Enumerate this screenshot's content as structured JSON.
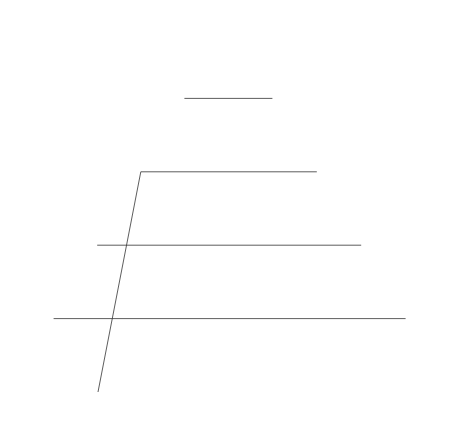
{
  "diagram": {
    "type": "ternary",
    "vertices": {
      "top": "CaO",
      "bottom_left": "FetO",
      "bottom_right": "CaCl2"
    },
    "vertex_labels": {
      "top": "CaO",
      "bottom_left_main": "Fe",
      "bottom_left_sub": "t",
      "bottom_left_tail": "O",
      "bottom_right_main": "CaCl",
      "bottom_right_sub": "2"
    },
    "axes": {
      "left": {
        "label_main": "N",
        "label_sub": "FetO",
        "ticks": [
          "0.2",
          "0.4",
          "0.6",
          "0.8"
        ]
      },
      "right": {
        "label_main": "N",
        "label_sub": "CaO",
        "ticks": [
          "0.8",
          "0.6",
          "0.4",
          "0.2"
        ]
      },
      "bottom": {
        "label_main": "N",
        "label_sub": "CACl2",
        "ticks": [
          "0.2",
          "0.4",
          "0.6",
          "0.8"
        ]
      }
    },
    "iso_activity_label_prefix_main": "a",
    "iso_activity_label_prefix_sub": "FetO",
    "iso_activity_labels": {
      "a06": "=0.6",
      "a05": "0.5",
      "a04": "0.4",
      "a03": "0.3",
      "a02": "0.2",
      "a07": "0.7",
      "a08": "0.8",
      "a09": "0.9",
      "one": "1"
    },
    "partial_label_left": "Cl",
    "partial_label_left_sub": "2"
  },
  "colors": {
    "line": "#1a1a1a",
    "grid": "#333333",
    "background": "#ffffff"
  }
}
